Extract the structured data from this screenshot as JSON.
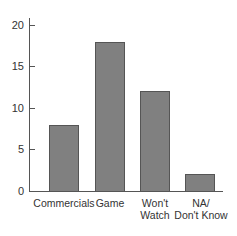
{
  "chart_data": {
    "type": "bar",
    "title": "",
    "xlabel": "",
    "ylabel": "",
    "categories": [
      "Commercials",
      "Game",
      "Won't Watch",
      "NA/ Don't Know"
    ],
    "values": [
      8,
      18,
      12,
      2
    ],
    "ylim": [
      0,
      20
    ],
    "yticks": [
      0,
      5,
      10,
      15,
      20
    ],
    "grid": false,
    "legend": null,
    "bar_color": "#808080"
  },
  "axis": {
    "yticks": [
      {
        "label": "0",
        "value": 0
      },
      {
        "label": "5",
        "value": 5
      },
      {
        "label": "10",
        "value": 10
      },
      {
        "label": "15",
        "value": 15
      },
      {
        "label": "20",
        "value": 20
      }
    ]
  },
  "bars": [
    {
      "label": "Commercials",
      "value": 8
    },
    {
      "label": "Game",
      "value": 18
    },
    {
      "label": "Won't\nWatch",
      "value": 12
    },
    {
      "label": "NA/\nDon't Know",
      "value": 2
    }
  ]
}
